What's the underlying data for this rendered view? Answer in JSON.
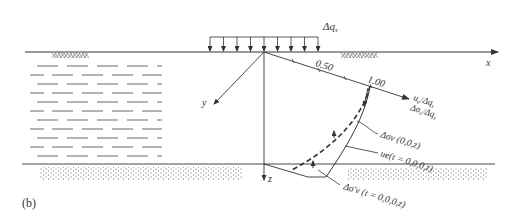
{
  "figure": {
    "panel_label": "(b)",
    "load_label": "Δq",
    "load_label_sub": "s",
    "x_axis_label": "x",
    "y_axis_label": "y",
    "z_axis_label": "z",
    "scale_ticks": [
      "0.50",
      "1.00"
    ],
    "axis_label_line1": "u",
    "axis_label_line1_sub": "e",
    "axis_label_line1_rest": "/Δq",
    "axis_label_line1_rest_sub": "s",
    "axis_label_line2": "Δσ",
    "axis_label_line2_sub": "v",
    "axis_label_line2_rest": "/Δq",
    "axis_label_line2_rest_sub": "s",
    "curve_labels": {
      "total_stress": "Δσv (0,0,z)",
      "pore_pressure": "ue(t = 0,0,0,z)",
      "effective_stress": "Δσ′v (t = 0,0,0,z)"
    },
    "layers": {
      "top_soil": "clay (dashed hatching)",
      "bottom_soil": "sand (dotted)"
    }
  },
  "colors": {
    "line": "#333333",
    "background": "#ffffff"
  }
}
